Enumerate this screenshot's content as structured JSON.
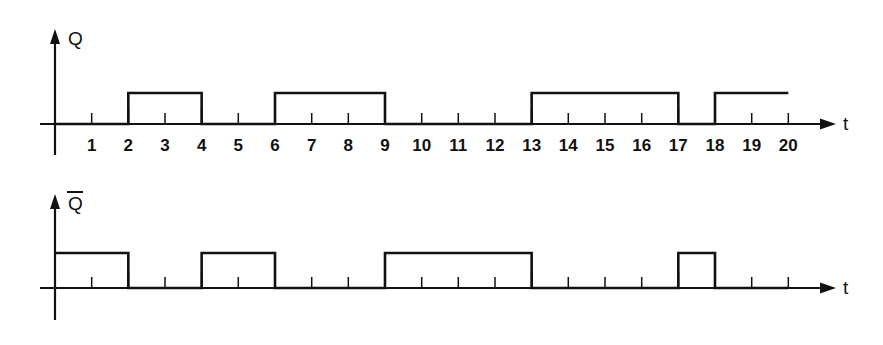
{
  "chart_data": [
    {
      "type": "line",
      "name": "Q",
      "title": "",
      "ylabel": "Q",
      "xlabel": "t",
      "grid": false,
      "legend": "none",
      "xlim": [
        0,
        20
      ],
      "ylim": [
        0,
        1
      ],
      "tick_labels": [
        "1",
        "2",
        "3",
        "4",
        "5",
        "6",
        "7",
        "8",
        "9",
        "10",
        "11",
        "12",
        "13",
        "14",
        "15",
        "16",
        "17",
        "18",
        "19",
        "20"
      ],
      "tick_values": [
        1,
        2,
        3,
        4,
        5,
        6,
        7,
        8,
        9,
        10,
        11,
        12,
        13,
        14,
        15,
        16,
        17,
        18,
        19,
        20
      ],
      "pulses": [
        {
          "start": 2,
          "end": 4,
          "level": 1
        },
        {
          "start": 6,
          "end": 9,
          "level": 1
        },
        {
          "start": 13,
          "end": 17,
          "level": 1
        },
        {
          "start": 18,
          "end": 20,
          "level": 1
        }
      ],
      "x": [
        0,
        2,
        2,
        4,
        4,
        6,
        6,
        9,
        9,
        13,
        13,
        17,
        17,
        18,
        18,
        20
      ],
      "values": [
        0,
        0,
        1,
        1,
        0,
        0,
        1,
        1,
        0,
        0,
        1,
        1,
        0,
        0,
        1,
        1
      ]
    },
    {
      "type": "line",
      "name": "Q-bar",
      "title": "",
      "ylabel": "Q",
      "ylabel_overbar": true,
      "xlabel": "t",
      "grid": false,
      "legend": "none",
      "xlim": [
        0,
        20
      ],
      "ylim": [
        0,
        1
      ],
      "tick_labels": [],
      "tick_values": [
        1,
        2,
        3,
        4,
        5,
        6,
        7,
        8,
        9,
        10,
        11,
        12,
        13,
        14,
        15,
        16,
        17,
        18,
        19,
        20
      ],
      "pulses": [
        {
          "start": 0,
          "end": 2,
          "level": 1
        },
        {
          "start": 4,
          "end": 6,
          "level": 1
        },
        {
          "start": 9,
          "end": 13,
          "level": 1
        },
        {
          "start": 17,
          "end": 18,
          "level": 1
        }
      ],
      "x": [
        0,
        2,
        2,
        4,
        4,
        6,
        6,
        9,
        9,
        13,
        13,
        17,
        17,
        18,
        18,
        20
      ],
      "values": [
        1,
        1,
        0,
        0,
        1,
        1,
        0,
        0,
        1,
        1,
        0,
        0,
        1,
        1,
        0,
        0
      ]
    }
  ],
  "figure": {
    "background_color": "#ffffff",
    "line_color": "#111111",
    "top_chart": {
      "y_axis_label": "Q",
      "x_axis_label": "t"
    },
    "bottom_chart": {
      "y_axis_label": "Q",
      "x_axis_label": "t"
    },
    "x_tick_labels": [
      "1",
      "2",
      "3",
      "4",
      "5",
      "6",
      "7",
      "8",
      "9",
      "10",
      "11",
      "12",
      "13",
      "14",
      "15",
      "16",
      "17",
      "18",
      "19",
      "20"
    ]
  }
}
